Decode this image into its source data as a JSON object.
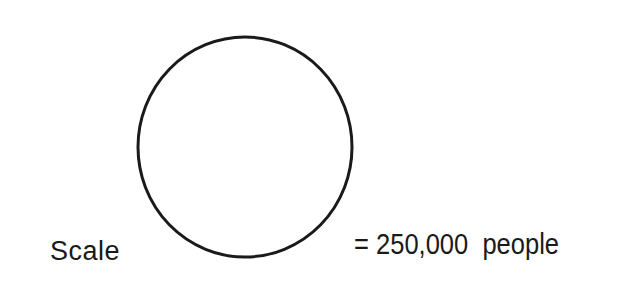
{
  "legend": {
    "scale_label": "Scale",
    "value_text": "= 250,000  people",
    "symbol": "circle",
    "represents_people": 250000
  },
  "colors": {
    "stroke": "#1a1a1a",
    "background": "#ffffff"
  }
}
